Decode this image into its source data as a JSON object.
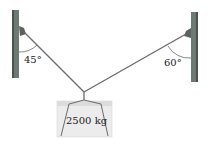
{
  "diagram": {
    "left_angle": "45°",
    "right_angle": "60°",
    "mass_label": "2500 kg",
    "colors": {
      "pole": "#6d7a72",
      "pole_dark": "#4a544e",
      "cable": "#6a6a6a",
      "block": "#ececec",
      "block_top": "#dcdcdc"
    }
  }
}
